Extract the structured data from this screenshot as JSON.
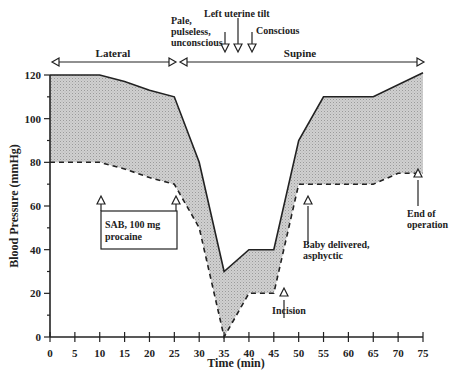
{
  "chart_data": {
    "type": "area",
    "title": "",
    "xlabel": "Time (min)",
    "ylabel": "Blood Pressure (mmHg)",
    "xlim": [
      0,
      75
    ],
    "ylim": [
      0,
      120
    ],
    "x_ticks": [
      0,
      5,
      10,
      15,
      20,
      25,
      30,
      35,
      40,
      45,
      50,
      55,
      60,
      65,
      70,
      75
    ],
    "y_ticks": [
      0,
      20,
      40,
      60,
      80,
      100,
      120
    ],
    "grid": false,
    "series": [
      {
        "name": "Systolic",
        "style": "solid",
        "x": [
          0,
          10,
          15,
          20,
          25,
          30,
          35,
          40,
          45,
          50,
          55,
          65,
          75
        ],
        "values": [
          120,
          120,
          117,
          113,
          110,
          80,
          30,
          40,
          40,
          90,
          110,
          110,
          121
        ]
      },
      {
        "name": "Diastolic",
        "style": "dashed",
        "x": [
          0,
          10,
          15,
          20,
          25,
          30,
          35,
          40,
          45,
          50,
          55,
          65,
          70,
          75
        ],
        "values": [
          80,
          80,
          77,
          73,
          70,
          50,
          0,
          20,
          20,
          70,
          70,
          70,
          75,
          75
        ]
      }
    ],
    "fill_between": {
      "color": "#c8c8c8"
    },
    "position_spans": [
      {
        "label": "Lateral",
        "from": 0,
        "to": 25
      },
      {
        "label": "Supine",
        "from": 25,
        "to": 75
      }
    ],
    "annotations": [
      {
        "label": "Pale, pulseless, unconscious",
        "x": 35,
        "position": "top"
      },
      {
        "label": "Left uterine tilt",
        "x": 37,
        "position": "top"
      },
      {
        "label": "Conscious",
        "x": 40,
        "position": "top"
      },
      {
        "label": "SAB, 100 mg procaine",
        "x": [
          10,
          25
        ],
        "position": "box"
      },
      {
        "label": "Incision",
        "x": 47,
        "position": "bottom"
      },
      {
        "label": "Baby delivered, asphyctic",
        "x": 52,
        "position": "bottom"
      },
      {
        "label": "End of operation",
        "x": 74,
        "position": "bottom"
      }
    ]
  },
  "labels": {
    "xlabel": "Time (min)",
    "ylabel": "Blood Pressure (mmHg)",
    "lateral": "Lateral",
    "supine": "Supine",
    "pale": [
      "Pale,",
      "pulseless,",
      "unconscious"
    ],
    "tilt": "Left uterine tilt",
    "conscious": "Conscious",
    "sab": [
      "SAB, 100 mg",
      "procaine"
    ],
    "incision": "Incision",
    "baby": [
      "Baby delivered,",
      "asphyctic"
    ],
    "end": [
      "End of",
      "operation"
    ]
  }
}
